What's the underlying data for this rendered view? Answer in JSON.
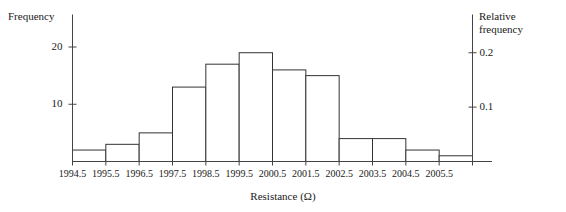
{
  "chart_data": {
    "type": "bar",
    "title": "",
    "xlabel": "Resistance (Ω)",
    "ylabel": "Frequency",
    "y2label": "Relative frequency",
    "grid": false,
    "legend": false,
    "bin_edges": [
      1994.5,
      1995.5,
      1996.5,
      1997.5,
      1998.5,
      1999.5,
      2000.5,
      2001.5,
      2002.5,
      2003.5,
      2004.5,
      2005.5,
      2006.5
    ],
    "categories": [
      "1994.5-1995.5",
      "1995.5-1996.5",
      "1996.5-1997.5",
      "1997.5-1998.5",
      "1998.5-1999.5",
      "1999.5-2000.5",
      "2000.5-2001.5",
      "2001.5-2002.5",
      "2002.5-2003.5",
      "2003.5-2004.5",
      "2004.5-2005.5",
      "2005.5-2006.5"
    ],
    "values": [
      2,
      3,
      5,
      13,
      17,
      19,
      16,
      15,
      4,
      4,
      2,
      1
    ],
    "relative_values": [
      0.021,
      0.032,
      0.053,
      0.137,
      0.179,
      0.2,
      0.168,
      0.158,
      0.042,
      0.042,
      0.021,
      0.011
    ],
    "ylim": [
      0,
      22
    ],
    "ylim_right": [
      0,
      0.2316
    ],
    "yticks": [
      10,
      20
    ],
    "ytick_labels": [
      "10",
      "20"
    ],
    "yticks_right": [
      0.1,
      0.2
    ],
    "ytick_labels_right": [
      "0.1",
      "0.2"
    ],
    "xtick_labels": [
      "1994.5",
      "1995.5",
      "1996.5",
      "1997.5",
      "1998.5",
      "1999.5",
      "2000.5",
      "2001.5",
      "2002.5",
      "2003.5",
      "2004.5",
      "2005.5"
    ],
    "bar_color": "#ffffff",
    "bar_edge_color": "#333333",
    "axis_color": "#444444"
  },
  "axes": {
    "left_axis_title": "Frequency",
    "right_axis_title": "Relative frequency",
    "x_axis_title": "Resistance (Ω)"
  }
}
